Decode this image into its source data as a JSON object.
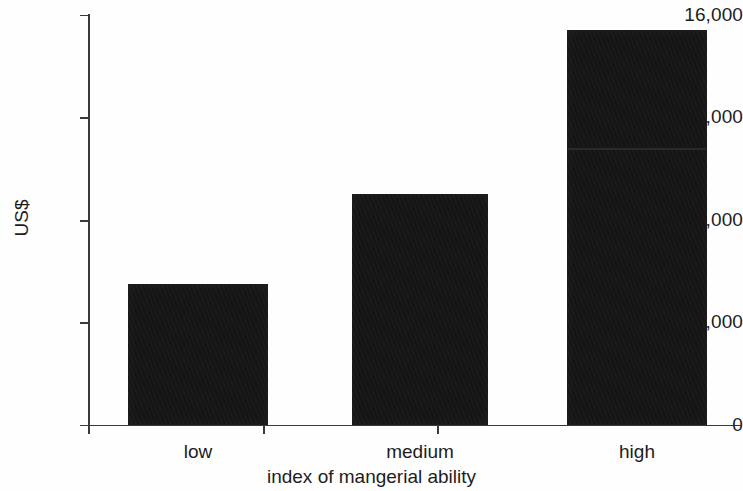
{
  "chart_data": {
    "type": "bar",
    "title": "",
    "subtitle": "",
    "xlabel": "index of mangerial ability",
    "ylabel": "US$",
    "categories": [
      "low",
      "medium",
      "high"
    ],
    "values": [
      5500,
      9000,
      15400
    ],
    "series": [
      {
        "name": "US$",
        "values": [
          5500,
          9000,
          15400
        ]
      }
    ],
    "ylim": [
      0,
      16000
    ],
    "y_ticks": [
      0,
      4000,
      8000,
      12000,
      16000
    ],
    "y_tick_labels": [
      "0",
      "4,000",
      "8,000",
      "12,000",
      "16,000"
    ],
    "x_ticks": [
      "",
      "",
      ""
    ],
    "grid": false,
    "legend": false,
    "legend_position": "none",
    "bar_color": "#131313",
    "axis_color": "#3a3a3a",
    "text_color": "#1d1d1d",
    "background_color": "#fefefe"
  },
  "axes": {
    "y_title": "US$",
    "x_title": "index of mangerial ability"
  },
  "ticks": {
    "y": [
      {
        "label": "16,000",
        "value": 16000
      },
      {
        "label": "12,000",
        "value": 12000
      },
      {
        "label": "8,000",
        "value": 8000
      },
      {
        "label": "4,000",
        "value": 4000
      },
      {
        "label": "0",
        "value": 0
      }
    ]
  },
  "bars": [
    {
      "label": "low",
      "value": 5500
    },
    {
      "label": "medium",
      "value": 9000
    },
    {
      "label": "high",
      "value": 15400
    }
  ]
}
